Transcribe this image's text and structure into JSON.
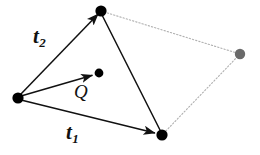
{
  "figure": {
    "background_color": "#ffffff",
    "width": 260,
    "height": 155,
    "solid_line_color": "#111111",
    "dotted_line_color": "#b0b0b0",
    "vertex_color": "#000000",
    "ghost_vertex_color": "#6a6a6a"
  },
  "labels": {
    "t2": {
      "base": "t",
      "sub": "2"
    },
    "t1": {
      "base": "t",
      "sub": "1"
    },
    "q": "Q"
  },
  "points": {
    "origin": {
      "name": "origin-vertex",
      "x": 18,
      "y": 98,
      "r": 5.6,
      "color": "#000000"
    },
    "top": {
      "name": "top-vertex",
      "x": 101,
      "y": 11,
      "r": 5.6,
      "color": "#000000"
    },
    "bottom_right": {
      "name": "bottom-right-vertex",
      "x": 162,
      "y": 135,
      "r": 5.6,
      "color": "#000000"
    },
    "q_tip": {
      "name": "q-endpoint",
      "x": 99,
      "y": 73,
      "r": 4.4,
      "color": "#000000"
    },
    "ghost": {
      "name": "ghost-vertex",
      "x": 240,
      "y": 54,
      "r": 5.2,
      "color": "#6a6a6a"
    }
  },
  "arrows": [
    {
      "name": "arrow-t2",
      "from": "origin",
      "to": "top",
      "style": "solid",
      "head": true
    },
    {
      "name": "arrow-q",
      "from": "origin",
      "to": "q_tip",
      "style": "solid",
      "head": true
    },
    {
      "name": "arrow-t1",
      "from": "origin",
      "to": "bottom_right",
      "style": "solid",
      "head": true
    }
  ],
  "lines": [
    {
      "name": "edge-top-to-bottom-right",
      "from": "top",
      "to": "bottom_right",
      "style": "solid",
      "head": false
    },
    {
      "name": "edge-top-to-ghost",
      "from": "top",
      "to": "ghost",
      "style": "dotted",
      "head": false
    },
    {
      "name": "edge-ghost-to-bottom-right",
      "from": "ghost",
      "to": "bottom_right",
      "style": "dotted",
      "head": false
    }
  ]
}
